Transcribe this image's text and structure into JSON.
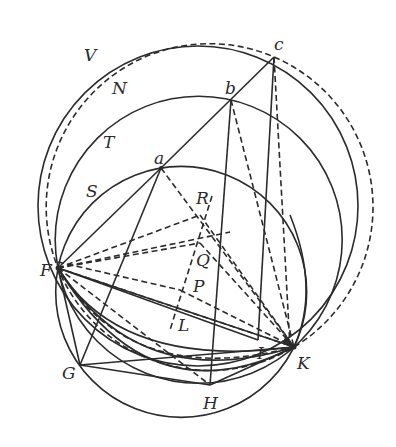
{
  "diagram": {
    "type": "geometric-construction",
    "stroke_color": "#2b2b2b",
    "background": "#ffffff",
    "labels": {
      "V": "V",
      "N": "N",
      "T": "T",
      "S": "S",
      "a": "a",
      "b": "b",
      "c": "c",
      "R": "R",
      "Q": "Q",
      "P": "P",
      "L": "L",
      "F": "F",
      "G": "G",
      "H": "H",
      "I": "I",
      "K": "K"
    },
    "points": {
      "F": [
        58,
        268
      ],
      "G": [
        80,
        365
      ],
      "H": [
        210,
        385
      ],
      "I": [
        258,
        340
      ],
      "K": [
        294,
        347
      ],
      "a": [
        161,
        168
      ],
      "b": [
        231,
        100
      ],
      "c": [
        274,
        57
      ],
      "R": [
        208,
        218
      ],
      "Q": [
        197,
        248
      ],
      "P": [
        183,
        288
      ],
      "L": [
        172,
        330
      ]
    },
    "circles": [
      {
        "name": "V",
        "style": "solid",
        "cx": 198,
        "cy": 206,
        "r": 160
      },
      {
        "name": "N",
        "style": "dashed",
        "cx": 209.6,
        "cy": 207.1,
        "r": 163.4
      },
      {
        "name": "T",
        "style": "solid",
        "cx": 198.7,
        "cy": 239.8,
        "r": 143.5
      },
      {
        "name": "S",
        "style": "solid",
        "cx": 181.2,
        "cy": 291.9,
        "r": 125.5
      }
    ]
  }
}
